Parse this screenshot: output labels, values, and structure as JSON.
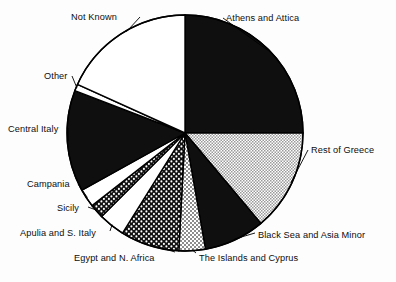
{
  "chart_data": {
    "type": "pie",
    "title": "",
    "subtitle": "",
    "xlabel": "",
    "ylabel": "",
    "grid": false,
    "legend_position": "labels-outside",
    "start_angle_deg": 0,
    "direction": "clockwise",
    "categories": [
      "Athens and Attica",
      "Rest of Greece",
      "Black Sea and Asia Minor",
      "The Islands and Cyprus",
      "Egypt and N. Africa",
      "Apulia and S. Italy",
      "Sicily",
      "Campania",
      "Central Italy",
      "Other",
      "Not Known"
    ],
    "values": [
      25.0,
      13.9,
      8.3,
      3.6,
      8.1,
      3.6,
      1.9,
      2.5,
      13.9,
      0.9,
      18.3
    ],
    "slices": [
      {
        "label": "Athens and Attica",
        "value": 25.0,
        "start_deg": 0.0,
        "end_deg": 90.0,
        "fill": "solid-black",
        "color": "#0f0f0f"
      },
      {
        "label": "Rest of Greece",
        "value": 13.9,
        "start_deg": 90.0,
        "end_deg": 140.0,
        "fill": "fine-stipple",
        "color": "#ffffff"
      },
      {
        "label": "Black Sea and Asia Minor",
        "value": 8.3,
        "start_deg": 140.0,
        "end_deg": 170.0,
        "fill": "solid-black",
        "color": "#0f0f0f"
      },
      {
        "label": "The Islands and Cyprus",
        "value": 3.6,
        "start_deg": 170.0,
        "end_deg": 183.0,
        "fill": "light-checker",
        "color": "#ffffff"
      },
      {
        "label": "Egypt and N. Africa",
        "value": 8.1,
        "start_deg": 183.0,
        "end_deg": 212.0,
        "fill": "dark-checker",
        "color": "#1a1a1a"
      },
      {
        "label": "Apulia and S. Italy",
        "value": 3.6,
        "start_deg": 212.0,
        "end_deg": 225.0,
        "fill": "white",
        "color": "#ffffff"
      },
      {
        "label": "Sicily",
        "value": 1.9,
        "start_deg": 225.0,
        "end_deg": 232.0,
        "fill": "dark-checker",
        "color": "#1a1a1a"
      },
      {
        "label": "Campania",
        "value": 2.5,
        "start_deg": 232.0,
        "end_deg": 241.0,
        "fill": "white",
        "color": "#ffffff"
      },
      {
        "label": "Central Italy",
        "value": 13.9,
        "start_deg": 241.0,
        "end_deg": 291.0,
        "fill": "solid-black",
        "color": "#0f0f0f"
      },
      {
        "label": "Other",
        "value": 0.9,
        "start_deg": 291.0,
        "end_deg": 294.3,
        "fill": "white",
        "color": "#ffffff"
      },
      {
        "label": "Not Known",
        "value": 18.3,
        "start_deg": 294.3,
        "end_deg": 360.0,
        "fill": "white",
        "color": "#ffffff"
      }
    ],
    "geometry": {
      "cx": 185,
      "cy": 133,
      "r": 118,
      "stroke": "#000000",
      "stroke_width": 1.4
    }
  },
  "labels": {
    "athens": "Athens and Attica",
    "rest_of_greece": "Rest of Greece",
    "black_sea": "Black Sea and Asia Minor",
    "islands": "The Islands and Cyprus",
    "egypt": "Egypt and N. Africa",
    "apulia": "Apulia and S. Italy",
    "sicily": "Sicily",
    "campania": "Campania",
    "central_italy": "Central Italy",
    "other": "Other",
    "not_known": "Not Known"
  }
}
